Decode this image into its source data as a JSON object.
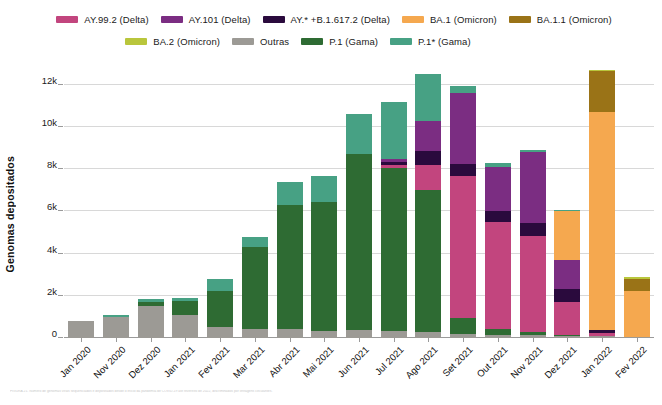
{
  "chart_data": {
    "type": "bar",
    "stacked": true,
    "title": "",
    "xlabel": "",
    "ylabel": "Genomas depositados",
    "ylim": [
      0,
      12800
    ],
    "yticks": [
      0,
      2000,
      4000,
      6000,
      8000,
      10000,
      12000
    ],
    "ytick_labels": [
      "0",
      "2k",
      "4k",
      "6k",
      "8k",
      "10k",
      "12k"
    ],
    "grid": "horizontal",
    "legend_position": "top",
    "categories": [
      "Jan 2020",
      "Nov 2020",
      "Dez 2020",
      "Jan 2021",
      "Fev 2021",
      "Mar 2021",
      "Abr 2021",
      "Mai 2021",
      "Jun 2021",
      "Jul 2021",
      "Ago 2021",
      "Set 2021",
      "Out 2021",
      "Nov 2021",
      "Dez 2021",
      "Jan 2022",
      "Fev 2022"
    ],
    "series": [
      {
        "name": "AY.99.2 (Delta)",
        "color": "#c2457e",
        "values": [
          0,
          0,
          0,
          0,
          0,
          0,
          0,
          0,
          0,
          120,
          1180,
          6700,
          5050,
          4550,
          1550,
          150,
          0
        ]
      },
      {
        "name": "AY.101 (Delta)",
        "color": "#7b2d82",
        "values": [
          0,
          0,
          0,
          0,
          0,
          0,
          0,
          0,
          0,
          130,
          1430,
          3350,
          2100,
          3400,
          1400,
          0,
          0
        ]
      },
      {
        "name": "AY.* +B.1.617.2 (Delta)",
        "color": "#2a0a3d",
        "values": [
          0,
          0,
          0,
          0,
          0,
          0,
          0,
          0,
          0,
          140,
          640,
          600,
          500,
          600,
          620,
          130,
          0
        ]
      },
      {
        "name": "BA.1 (Omicron)",
        "color": "#f5a84f",
        "values": [
          0,
          0,
          0,
          0,
          0,
          0,
          0,
          0,
          0,
          0,
          0,
          0,
          0,
          0,
          2300,
          10350,
          2200
        ]
      },
      {
        "name": "BA.1.1 (Omicron)",
        "color": "#9a7317",
        "values": [
          0,
          0,
          0,
          0,
          0,
          0,
          0,
          0,
          0,
          0,
          0,
          0,
          0,
          0,
          0,
          1950,
          580
        ]
      },
      {
        "name": "BA.2 (Omicron)",
        "color": "#b9c63c",
        "values": [
          0,
          0,
          0,
          0,
          0,
          0,
          0,
          0,
          0,
          0,
          0,
          0,
          0,
          0,
          0,
          30,
          40
        ]
      },
      {
        "name": "Outras",
        "color": "#9c9a95",
        "values": [
          820,
          990,
          1500,
          1100,
          520,
          430,
          440,
          340,
          380,
          320,
          270,
          180,
          120,
          120,
          100,
          80,
          40
        ]
      },
      {
        "name": "P.1 (Gama)",
        "color": "#2e6b33",
        "values": [
          0,
          0,
          230,
          650,
          1720,
          3870,
          5850,
          6100,
          8320,
          7760,
          6770,
          790,
          330,
          170,
          50,
          0,
          0
        ]
      },
      {
        "name": "P.1* (Gama)",
        "color": "#47a184",
        "values": [
          0,
          120,
          130,
          140,
          580,
          500,
          1100,
          1250,
          1900,
          2700,
          2250,
          330,
          200,
          70,
          50,
          0,
          0
        ]
      }
    ],
    "bar_totals": [
      820,
      1110,
      1860,
      1890,
      2820,
      4800,
      7390,
      7690,
      10600,
      11170,
      12540,
      11950,
      8300,
      8910,
      6070,
      12690,
      2860
    ],
    "stack_order_bottom_to_top": [
      "Outras",
      "P.1 (Gama)",
      "AY.99.2 (Delta)",
      "AY.* +B.1.617.2 (Delta)",
      "AY.101 (Delta)",
      "BA.1 (Omicron)",
      "BA.1.1 (Omicron)",
      "BA.2 (Omicron)",
      "P.1* (Gama)"
    ]
  },
  "legend": {
    "rows": [
      [
        {
          "label": "AY.99.2 (Delta)",
          "color": "#c2457e"
        },
        {
          "label": "AY.101 (Delta)",
          "color": "#7b2d82"
        },
        {
          "label": "AY.* +B.1.617.2 (Delta)",
          "color": "#2a0a3d"
        },
        {
          "label": "BA.1 (Omicron)",
          "color": "#f5a84f"
        },
        {
          "label": "BA.1.1 (Omicron)",
          "color": "#9a7317"
        }
      ],
      [
        {
          "label": "BA.2 (Omicron)",
          "color": "#b9c63c"
        },
        {
          "label": "Outras",
          "color": "#9c9a95"
        },
        {
          "label": "P.1 (Gama)",
          "color": "#2e6b33"
        },
        {
          "label": "P.1* (Gama)",
          "color": "#47a184"
        }
      ]
    ]
  },
  "caption": {
    "text": "FIGURA 21. Número de genomas virais sequenciados e depositados desde o início da pandemia de COVID-19 até fevereiro de 2022, discriminados por linhagens circulantes."
  }
}
